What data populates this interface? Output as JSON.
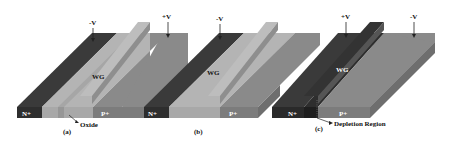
{
  "figure": {
    "panels": [
      {
        "id": "a",
        "caption": "(a)",
        "labels": {
          "n_region": "N+",
          "p_region": "P+",
          "waveguide": "WG",
          "left_voltage": "-V",
          "right_voltage": "+V",
          "annotation": "Oxide"
        }
      },
      {
        "id": "b",
        "caption": "(b)",
        "labels": {
          "n_region": "N+",
          "p_region": "P+",
          "waveguide": "WG",
          "left_voltage": "-V",
          "right_voltage": "+V"
        }
      },
      {
        "id": "c",
        "caption": "(c)",
        "labels": {
          "n_region": "N+",
          "p_region": "P+",
          "waveguide": "WG",
          "left_voltage": "+V",
          "right_voltage": "-V",
          "annotation": "Depletion Region"
        }
      }
    ],
    "colors": {
      "n_plus": "#3a3a3a",
      "n_plus_side": "#2a2a2a",
      "intrinsic": "#b4b4b4",
      "intrinsic_front": "#a8a8a8",
      "p_plus": "#8a8a8a",
      "p_plus_front": "#7c7c7c",
      "rib_top": "#bdbdbd",
      "rib_side": "#8e8e8e",
      "text_light": "#ffffff",
      "text_dark": "#111111"
    }
  }
}
